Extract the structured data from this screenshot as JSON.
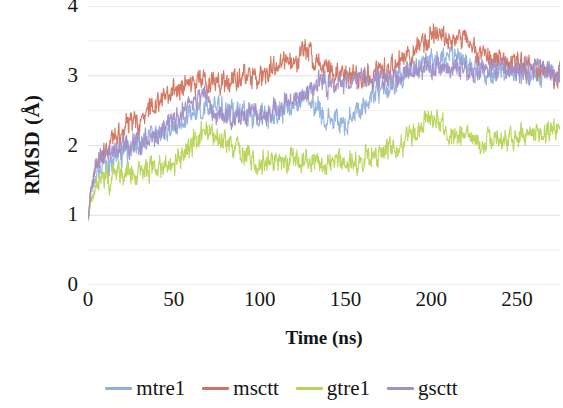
{
  "chart_data": {
    "type": "line",
    "title": "",
    "xlabel": "Time (ns)",
    "ylabel": "RMSD (Å)",
    "xlim": [
      0,
      275
    ],
    "ylim": [
      0,
      4
    ],
    "xticks": [
      0,
      50,
      100,
      150,
      200,
      250
    ],
    "yticks": [
      0,
      1,
      2,
      3,
      4
    ],
    "minor_gridline_step": 0.5,
    "grid": true,
    "grid_color": "#d9d9d9",
    "legend_position": "bottom",
    "noise_amplitude": 0.13,
    "series": [
      {
        "name": "mtre1",
        "color": "#8FB0DE",
        "control_x": [
          0,
          2,
          5,
          10,
          18,
          28,
          40,
          52,
          62,
          70,
          80,
          92,
          105,
          115,
          125,
          133,
          140,
          150,
          160,
          170,
          180,
          190,
          200,
          208,
          215,
          225,
          235,
          245,
          255,
          265,
          275
        ],
        "control_y": [
          0.95,
          1.35,
          1.55,
          1.7,
          1.85,
          2.0,
          2.15,
          2.3,
          2.45,
          2.55,
          2.5,
          2.45,
          2.4,
          2.55,
          2.7,
          2.55,
          2.35,
          2.3,
          2.55,
          2.8,
          2.95,
          3.1,
          3.2,
          3.3,
          3.25,
          3.1,
          3.05,
          3.1,
          3.05,
          3.0,
          3.0
        ]
      },
      {
        "name": "msctt",
        "color": "#D2725C",
        "control_x": [
          0,
          2,
          5,
          10,
          18,
          28,
          38,
          48,
          58,
          68,
          78,
          88,
          98,
          108,
          118,
          128,
          135,
          145,
          155,
          165,
          175,
          185,
          195,
          203,
          210,
          218,
          228,
          238,
          248,
          258,
          268,
          275
        ],
        "control_y": [
          0.95,
          1.45,
          1.7,
          1.9,
          2.15,
          2.35,
          2.55,
          2.75,
          2.9,
          2.95,
          2.9,
          2.95,
          3.0,
          3.1,
          3.2,
          3.35,
          3.15,
          3.05,
          2.95,
          3.0,
          3.1,
          3.3,
          3.45,
          3.6,
          3.5,
          3.55,
          3.35,
          3.25,
          3.2,
          3.15,
          3.05,
          3.0
        ]
      },
      {
        "name": "gtre1",
        "color": "#B6D455",
        "control_x": [
          0,
          2,
          5,
          10,
          18,
          28,
          40,
          52,
          62,
          70,
          78,
          88,
          98,
          108,
          118,
          128,
          138,
          148,
          158,
          168,
          178,
          188,
          198,
          205,
          212,
          222,
          232,
          242,
          252,
          262,
          275
        ],
        "control_y": [
          0.92,
          1.25,
          1.4,
          1.5,
          1.58,
          1.65,
          1.7,
          1.8,
          2.05,
          2.2,
          2.1,
          1.9,
          1.78,
          1.75,
          1.82,
          1.8,
          1.72,
          1.78,
          1.8,
          1.85,
          1.95,
          2.1,
          2.35,
          2.3,
          2.15,
          2.05,
          2.05,
          2.1,
          2.15,
          2.2,
          2.25
        ]
      },
      {
        "name": "gsctt",
        "color": "#A08FC8",
        "control_x": [
          0,
          2,
          5,
          10,
          18,
          28,
          40,
          50,
          60,
          68,
          75,
          85,
          95,
          105,
          115,
          125,
          135,
          145,
          155,
          165,
          175,
          185,
          195,
          205,
          215,
          225,
          235,
          245,
          255,
          265,
          275
        ],
        "control_y": [
          0.95,
          1.4,
          1.7,
          1.85,
          1.95,
          2.05,
          2.15,
          2.35,
          2.6,
          2.7,
          2.45,
          2.4,
          2.5,
          2.45,
          2.6,
          2.75,
          2.9,
          2.85,
          2.95,
          3.0,
          2.95,
          3.05,
          3.15,
          3.1,
          3.15,
          3.1,
          3.05,
          3.1,
          3.05,
          3.1,
          3.05
        ]
      }
    ]
  },
  "axes": {
    "ytick_labels": [
      "4",
      "3",
      "2",
      "1",
      "0"
    ],
    "xtick_labels": [
      "0",
      "50",
      "100",
      "150",
      "200",
      "250"
    ]
  },
  "legend": {
    "items": [
      {
        "label": "mtre1",
        "color": "#8FB0DE"
      },
      {
        "label": "msctt",
        "color": "#D2725C"
      },
      {
        "label": "gtre1",
        "color": "#B6D455"
      },
      {
        "label": "gsctt",
        "color": "#A08FC8"
      }
    ]
  }
}
